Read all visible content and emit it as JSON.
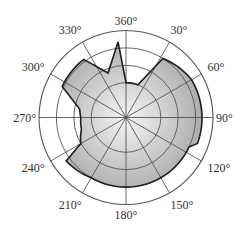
{
  "chart_data": {
    "type": "polar-area",
    "title": "",
    "angle_labels": [
      "360°",
      "30°",
      "60°",
      "90°",
      "120°",
      "150°",
      "180°",
      "210°",
      "240°",
      "270°",
      "300°",
      "330°"
    ],
    "angle_ticks": [
      0,
      30,
      60,
      90,
      120,
      150,
      180,
      210,
      240,
      270,
      300,
      330
    ],
    "radial_rings": [
      2,
      3,
      4,
      5
    ],
    "radial_max": 5,
    "grid": true,
    "direction": "clockwise",
    "zero_location": "top",
    "series": [
      {
        "name": "profile",
        "points": [
          {
            "angle": 0,
            "r": 2.0
          },
          {
            "angle": 20,
            "r": 2.0
          },
          {
            "angle": 32,
            "r": 4.0
          },
          {
            "angle": 60,
            "r": 4.35
          },
          {
            "angle": 90,
            "r": 4.37
          },
          {
            "angle": 110,
            "r": 4.37
          },
          {
            "angle": 115,
            "r": 4.0
          },
          {
            "angle": 150,
            "r": 4.0
          },
          {
            "angle": 180,
            "r": 4.0
          },
          {
            "angle": 210,
            "r": 4.0
          },
          {
            "angle": 234,
            "r": 4.25
          },
          {
            "angle": 240,
            "r": 3.0
          },
          {
            "angle": 255,
            "r": 2.65
          },
          {
            "angle": 270,
            "r": 2.6
          },
          {
            "angle": 280,
            "r": 2.7
          },
          {
            "angle": 296,
            "r": 4.08
          },
          {
            "angle": 310,
            "r": 4.1
          },
          {
            "angle": 324,
            "r": 4.13
          },
          {
            "angle": 338,
            "r": 2.76
          },
          {
            "angle": 354,
            "r": 4.37
          },
          {
            "angle": 360,
            "r": 2.0
          }
        ]
      }
    ],
    "colors": {
      "fill_center": "#f6f6f6",
      "fill_edge": "#a9a9a9",
      "outline": "#1e1e1e",
      "grid": "#555555"
    }
  }
}
